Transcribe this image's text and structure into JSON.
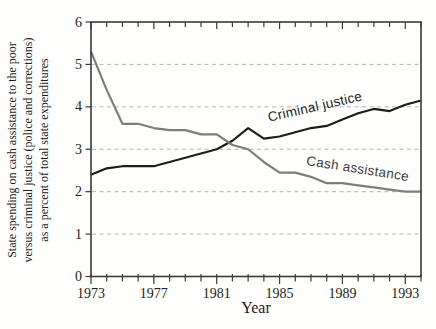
{
  "window": {
    "width": 436,
    "height": 329
  },
  "colors": {
    "background": "#fefefd",
    "frame": "#3a3a3a",
    "grid": "#b4b4b4",
    "text": "#1c1c1c",
    "criminal_justice_line": "#1d1d1d",
    "cash_assistance_line": "#7d7d7d",
    "criminal_justice_label": "#222222",
    "cash_assistance_label": "#3d3d3d"
  },
  "chart_data": {
    "type": "line",
    "title": "",
    "xlabel": "Year",
    "ylabel_lines": [
      "State spending on cash assistance to the poor",
      "versus criminal justice (police and corrections)",
      "as a percent of total state expenditures"
    ],
    "xlim": [
      1973,
      1994
    ],
    "ylim": [
      0,
      6
    ],
    "x_major_ticks": [
      1973,
      1977,
      1981,
      1985,
      1989,
      1993
    ],
    "x_minor_tick_step": 1,
    "y_ticks": [
      0,
      1,
      2,
      3,
      4,
      5,
      6
    ],
    "grid_y": [
      1,
      2,
      3,
      4,
      5
    ],
    "grid_style": "dashed",
    "legend_position": "inline-curve-labels",
    "x": [
      1973,
      1974,
      1975,
      1976,
      1977,
      1978,
      1979,
      1980,
      1981,
      1982,
      1983,
      1984,
      1985,
      1986,
      1987,
      1988,
      1989,
      1990,
      1991,
      1992,
      1993,
      1994
    ],
    "series": [
      {
        "name": "Criminal justice",
        "color_key": "criminal_justice_line",
        "label_color_key": "criminal_justice_label",
        "values": [
          2.4,
          2.55,
          2.6,
          2.6,
          2.6,
          2.7,
          2.8,
          2.9,
          3.0,
          3.2,
          3.5,
          3.25,
          3.3,
          3.4,
          3.5,
          3.55,
          3.7,
          3.85,
          3.95,
          3.9,
          4.05,
          4.15
        ],
        "label": {
          "text": "Criminal justice",
          "px": 316,
          "py": 111,
          "rotate": -13
        }
      },
      {
        "name": "Cash assistance",
        "color_key": "cash_assistance_line",
        "label_color_key": "cash_assistance_label",
        "values": [
          5.3,
          4.4,
          3.6,
          3.6,
          3.5,
          3.45,
          3.45,
          3.35,
          3.35,
          3.1,
          3.0,
          2.7,
          2.45,
          2.45,
          2.35,
          2.2,
          2.2,
          2.15,
          2.1,
          2.05,
          2.0,
          2.0
        ],
        "label": {
          "text": "Cash assistance",
          "px": 357,
          "py": 173,
          "rotate": 9
        }
      }
    ]
  }
}
